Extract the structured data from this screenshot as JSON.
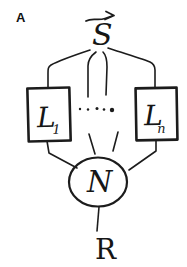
{
  "panel": {
    "label": "A"
  },
  "diagram": {
    "source_label": "S",
    "left_box": {
      "main": "L",
      "sub": "1"
    },
    "right_box": {
      "main": "L",
      "sub": "n"
    },
    "ellipsis_dots": 5,
    "network_label": "N",
    "output_label": "R"
  },
  "icons": {
    "top_arrow": "right-arrow"
  },
  "colors": {
    "ink": "#1c1c1c",
    "box_fill": "#b3b3b3",
    "circle_fill": "#ececec",
    "background": "#ffffff"
  }
}
